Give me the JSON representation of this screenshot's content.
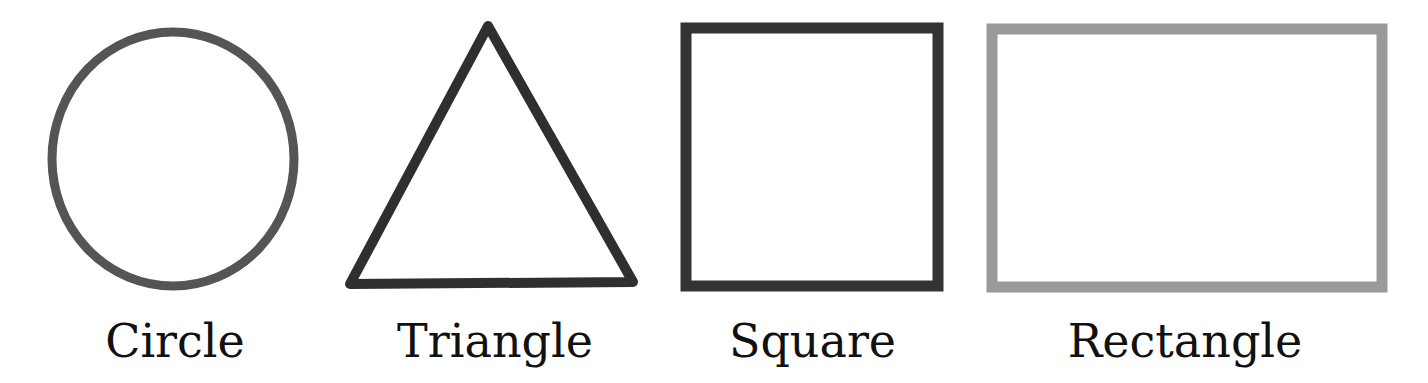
{
  "shapes": [
    {
      "name": "circle",
      "label": "Circle",
      "color": "#555555"
    },
    {
      "name": "triangle",
      "label": "Triangle",
      "color": "#2f2f2f"
    },
    {
      "name": "square",
      "label": "Square",
      "color": "#333333"
    },
    {
      "name": "rectangle",
      "label": "Rectangle",
      "color": "#9a9a9a"
    }
  ]
}
